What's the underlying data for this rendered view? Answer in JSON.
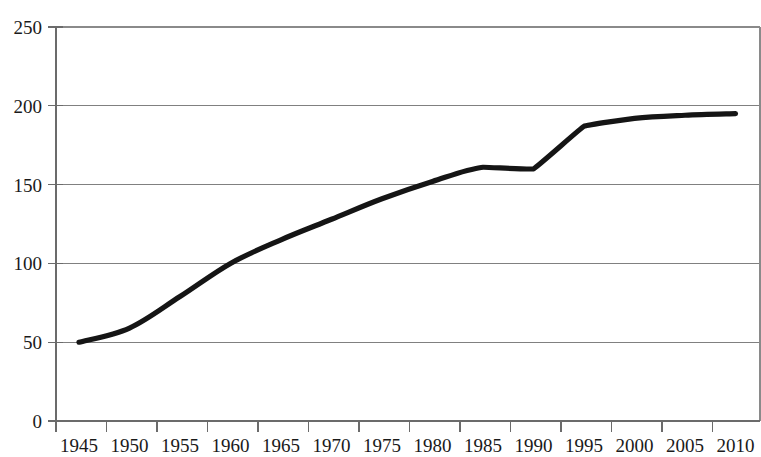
{
  "chart_data": {
    "type": "line",
    "title": "",
    "subtitle": "",
    "xlabel": "",
    "ylabel": "",
    "categories": [
      "1945",
      "1950",
      "1955",
      "1960",
      "1965",
      "1970",
      "1975",
      "1980",
      "1985",
      "1990",
      "1995",
      "2000",
      "2005",
      "2010"
    ],
    "x": [
      1945,
      1950,
      1955,
      1960,
      1965,
      1970,
      1975,
      1980,
      1985,
      1990,
      1995,
      2000,
      2005,
      2010
    ],
    "values": [
      50,
      59,
      79,
      100,
      115,
      128,
      141,
      152,
      161,
      160,
      187,
      192,
      194,
      195
    ],
    "series": [
      {
        "name": "series-1",
        "values": [
          50,
          59,
          79,
          100,
          115,
          128,
          141,
          152,
          161,
          160,
          187,
          192,
          194,
          195
        ],
        "color": "#151515"
      }
    ],
    "ylim": [
      0,
      250
    ],
    "xlim": [
      1942.5,
      2012.5
    ],
    "yticks": [
      0,
      50,
      100,
      150,
      200,
      250
    ],
    "ytick_labels": [
      "0",
      "50",
      "100",
      "150",
      "200",
      "250"
    ],
    "xtick_labels": [
      "1945",
      "1950",
      "1955",
      "1960",
      "1965",
      "1970",
      "1975",
      "1980",
      "1985",
      "1990",
      "1995",
      "2000",
      "2005",
      "2010"
    ],
    "grid": true,
    "grid_axis": "y",
    "legend": false,
    "legend_position": "none",
    "annotations": []
  },
  "colors": {
    "background": "#ffffff",
    "series": "#151515",
    "gridline": "#808080",
    "axis": "#6b6b6b",
    "text": "#1a1a1a"
  }
}
